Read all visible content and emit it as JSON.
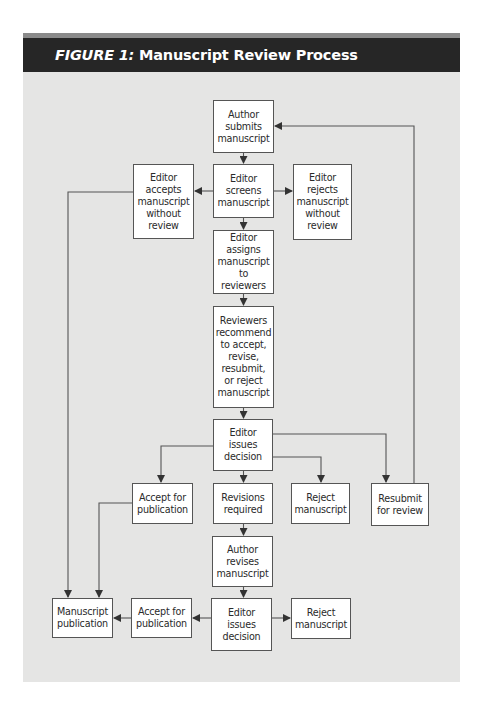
{
  "figure": {
    "label": "FIGURE 1:",
    "title": "Manuscript Review Process",
    "colors": {
      "header_bg": "#262626",
      "header_strip": "#8a8a8a",
      "panel_bg": "#e5e5e4",
      "box_bg": "#ffffff",
      "box_border": "#555555",
      "connector": "#444444"
    }
  },
  "nodes": {
    "author_submits": "Author\nsubmits\nmanuscript",
    "editor_screens": "Editor\nscreens\nmanuscript",
    "editor_accepts_without_review": "Editor\naccepts\nmanuscript\nwithout\nreview",
    "editor_rejects_without_review": "Editor\nrejects\nmanuscript\nwithout\nreview",
    "editor_assigns": "Editor\nassigns\nmanuscript\nto reviewers",
    "reviewers_recommend": "Reviewers\nrecommend\nto accept,\nrevise,\nresubmit,\nor reject\nmanuscript",
    "editor_issues_decision_1": "Editor\nissues\ndecision",
    "accept_for_publication_1": "Accept for\npublication",
    "revisions_required": "Revisions\nrequired",
    "reject_manuscript_1": "Reject\nmanuscript",
    "resubmit_for_review": "Resubmit\nfor review",
    "author_revises": "Author\nrevises\nmanuscript",
    "manuscript_publication": "Manuscript\npublication",
    "accept_for_publication_2": "Accept for\npublication",
    "editor_issues_decision_2": "Editor\nissues\ndecision",
    "reject_manuscript_2": "Reject\nmanuscript"
  },
  "edges": [
    {
      "from": "author_submits",
      "to": "editor_screens"
    },
    {
      "from": "editor_screens",
      "to": "editor_accepts_without_review"
    },
    {
      "from": "editor_screens",
      "to": "editor_rejects_without_review"
    },
    {
      "from": "editor_screens",
      "to": "editor_assigns"
    },
    {
      "from": "editor_assigns",
      "to": "reviewers_recommend"
    },
    {
      "from": "reviewers_recommend",
      "to": "editor_issues_decision_1"
    },
    {
      "from": "editor_issues_decision_1",
      "to": "accept_for_publication_1"
    },
    {
      "from": "editor_issues_decision_1",
      "to": "revisions_required"
    },
    {
      "from": "editor_issues_decision_1",
      "to": "reject_manuscript_1"
    },
    {
      "from": "editor_issues_decision_1",
      "to": "resubmit_for_review"
    },
    {
      "from": "resubmit_for_review",
      "to": "author_submits"
    },
    {
      "from": "revisions_required",
      "to": "author_revises"
    },
    {
      "from": "author_revises",
      "to": "editor_issues_decision_2"
    },
    {
      "from": "editor_issues_decision_2",
      "to": "accept_for_publication_2"
    },
    {
      "from": "editor_issues_decision_2",
      "to": "reject_manuscript_2"
    },
    {
      "from": "accept_for_publication_2",
      "to": "manuscript_publication"
    },
    {
      "from": "accept_for_publication_1",
      "to": "manuscript_publication"
    },
    {
      "from": "editor_accepts_without_review",
      "to": "manuscript_publication"
    }
  ]
}
